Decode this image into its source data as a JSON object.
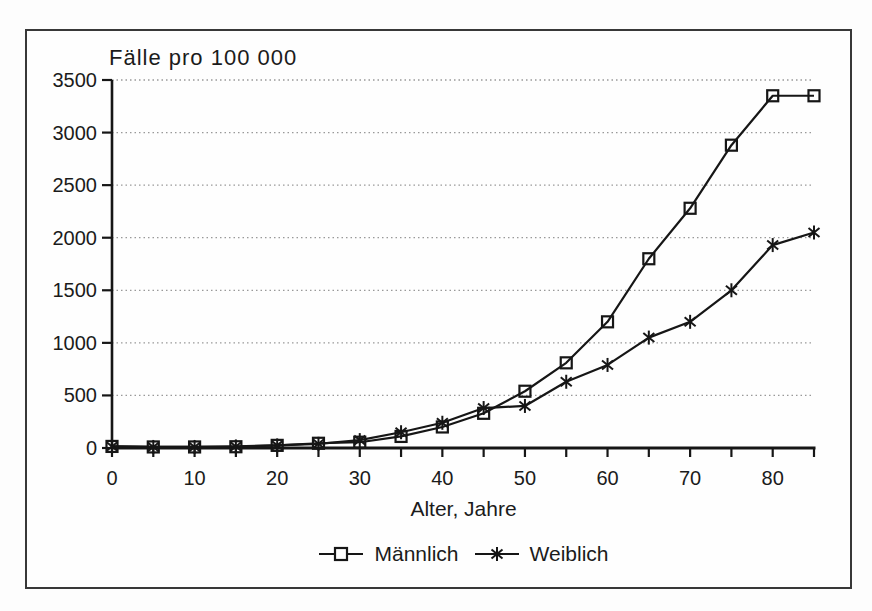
{
  "figure": {
    "background_color": "#fdfdfd",
    "frame_color": "#383838",
    "line_color": "#161616",
    "grid_color": "#999999"
  },
  "chart_data": {
    "type": "line",
    "title": "Fälle pro 100 000",
    "xlabel": "Alter, Jahre",
    "ylabel": "",
    "x": [
      0,
      5,
      10,
      15,
      20,
      25,
      30,
      35,
      40,
      45,
      50,
      55,
      60,
      65,
      70,
      75,
      80,
      85
    ],
    "series": [
      {
        "name": "Männlich",
        "marker": "square",
        "values": [
          15,
          10,
          10,
          12,
          25,
          45,
          55,
          110,
          200,
          330,
          540,
          810,
          1200,
          1800,
          2280,
          2880,
          3350,
          3350
        ]
      },
      {
        "name": "Weiblich",
        "marker": "asterisk",
        "values": [
          15,
          10,
          10,
          15,
          25,
          40,
          75,
          150,
          240,
          380,
          400,
          630,
          790,
          1050,
          1200,
          1500,
          1930,
          2050
        ]
      }
    ],
    "xlim": [
      0,
      85
    ],
    "ylim": [
      0,
      3500
    ],
    "yticks": [
      0,
      500,
      1000,
      1500,
      2000,
      2500,
      3000,
      3500
    ],
    "xtick_labels": [
      0,
      10,
      20,
      30,
      40,
      50,
      60,
      70,
      80
    ],
    "xtick_minor_step": 5,
    "grid": "horizontal dotted",
    "legend_position": "bottom"
  }
}
